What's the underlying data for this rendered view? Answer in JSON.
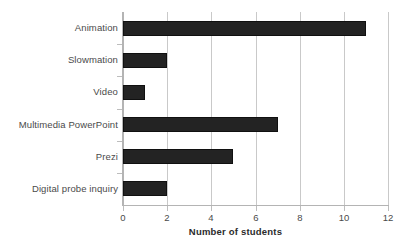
{
  "chart_data": {
    "type": "bar",
    "orientation": "horizontal",
    "title": "",
    "xlabel": "Number of students",
    "ylabel": "",
    "categories": [
      "Animation",
      "Slowmation",
      "Video",
      "Multimedia PowerPoint",
      "Prezi",
      "Digital probe inquiry"
    ],
    "values": [
      11,
      2,
      1,
      7,
      5,
      2
    ],
    "xlim": [
      0,
      12
    ],
    "xticks": [
      0,
      2,
      4,
      6,
      8,
      10,
      12
    ],
    "xtick_labels": [
      "0",
      "2",
      "4",
      "6",
      "8",
      "10",
      "12"
    ],
    "grid": "vertical",
    "legend": "none",
    "bar_color": "#232323",
    "grid_color": "#c9c9c9",
    "axis_color": "#b4b4b4",
    "text_color": "#4a4a4a",
    "background_color": "#ffffff"
  }
}
